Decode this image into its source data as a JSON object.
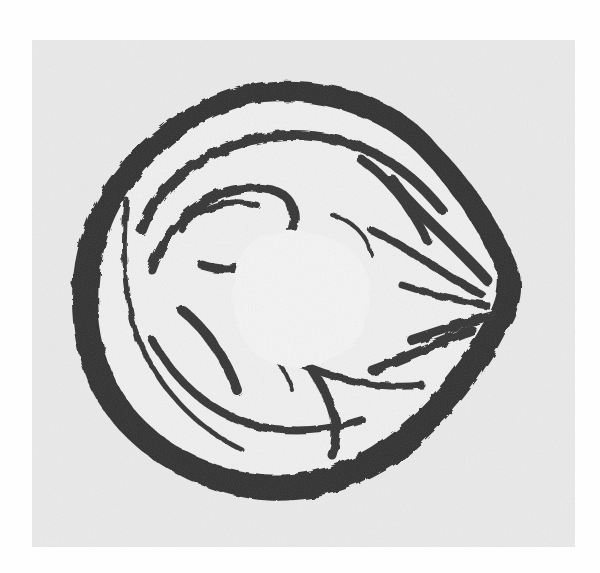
{
  "image": {
    "kind": "grayscale photomicrograph",
    "subject": "cross-section of rounded specimen with thick dark outer wall, folded inner layers and pale central cavity",
    "caption": "",
    "colors": {
      "page_background": "#fefefe",
      "plate_background": "#ebebeb",
      "wall_dark": "#2a2a2a",
      "tissue_mid": "#4a4a4a",
      "lumen_light": "#f4f4f4"
    },
    "plate_bounds": {
      "x": 32,
      "y": 40,
      "width": 543,
      "height": 507
    }
  }
}
